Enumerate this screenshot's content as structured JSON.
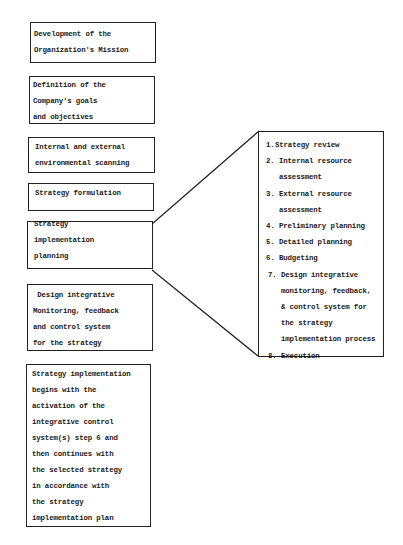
{
  "diagram": {
    "left_column": [
      {
        "id": "mission",
        "lines": [
          "Development of the",
          "Organization's Mission"
        ]
      },
      {
        "id": "goals",
        "lines": [
          "Definition of the",
          "Company's goals",
          "and objectives"
        ]
      },
      {
        "id": "scanning",
        "lines": [
          "Internal and external",
          "environmental scanning"
        ]
      },
      {
        "id": "formulation",
        "lines": [
          "Strategy formulation"
        ]
      },
      {
        "id": "impl-planning",
        "lines": [
          "Strategy",
          "implementation",
          "planning"
        ]
      },
      {
        "id": "monitoring",
        "lines": [
          " Design integrative",
          "Monitoring, feedback",
          "and control system",
          "for the strategy"
        ]
      },
      {
        "id": "execution",
        "lines": [
          "Strategy implementation",
          "begins with the",
          "activation of the",
          "integrative control",
          "system(s) step 6 and",
          "then continues with",
          "the selected strategy",
          "in accordance with",
          "the strategy",
          "implementation plan"
        ]
      }
    ],
    "detail_box": {
      "expands": "impl-planning",
      "items": [
        {
          "num": "1.",
          "lines": [
            "Strategy review"
          ]
        },
        {
          "num": "2.",
          "lines": [
            "Internal resource",
            "assessment"
          ]
        },
        {
          "num": "3.",
          "lines": [
            "External resource",
            "assessment"
          ]
        },
        {
          "num": "4.",
          "lines": [
            "Preliminary planning"
          ]
        },
        {
          "num": "5.",
          "lines": [
            "Detailed planning"
          ]
        },
        {
          "num": "6.",
          "lines": [
            "Budgeting"
          ]
        },
        {
          "num": "7.",
          "lines": [
            "Design integrative",
            "monitoring, feedback,",
            "& control system for",
            "the strategy",
            "implementation process"
          ]
        },
        {
          "num": "8.",
          "lines": [
            "Execution"
          ]
        }
      ]
    },
    "colors": {
      "stroke": "#222222",
      "text": "#1a1a1a",
      "background": "#ffffff"
    }
  }
}
